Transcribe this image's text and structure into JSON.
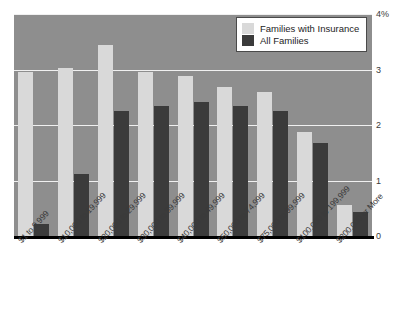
{
  "chart_data": {
    "type": "bar",
    "title": "",
    "xlabel": "",
    "ylabel": "",
    "ylim": [
      0,
      4
    ],
    "yticks": [
      "0",
      "1",
      "2",
      "3",
      "4%"
    ],
    "grid": true,
    "legend_position": "top-right",
    "categories": [
      "$1 to 9,999",
      "$10,000 to 19,999",
      "$20,000 to 29,999",
      "$30,000 to 39,999",
      "$40,000 to 49,999",
      "$50,000 to 74,999",
      "$75,000 to 99,999",
      "$100,000 to 199,999",
      "$200,000 or More"
    ],
    "series": [
      {
        "name": "Families with Insurance",
        "color": "#d9d9d9",
        "values": [
          2.95,
          3.02,
          3.45,
          2.95,
          2.88,
          2.68,
          2.6,
          1.87,
          0.55
        ]
      },
      {
        "name": "All Families",
        "color": "#3b3b3b",
        "values": [
          0.22,
          1.12,
          2.25,
          2.35,
          2.42,
          2.35,
          2.25,
          1.67,
          0.44
        ]
      }
    ]
  },
  "legend": {
    "entries": [
      {
        "label": "Families with Insurance",
        "swatch": "light"
      },
      {
        "label": "All Families",
        "swatch": "dark"
      }
    ]
  },
  "colors": {
    "plot_background": "#8e8e8e",
    "gridline": "#f0f0f0",
    "axis": "#000000",
    "series_light": "#d9d9d9",
    "series_dark": "#3b3b3b",
    "text": "#3a3a3a"
  }
}
